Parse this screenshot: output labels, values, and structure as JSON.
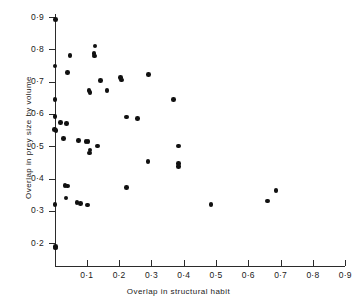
{
  "figure": {
    "background_color": "#ffffff",
    "point_color": "#111111",
    "axis_color": "#2b2b2b"
  },
  "chart_data": {
    "type": "scatter",
    "title": "",
    "xlabel": "Overlap in structural  habit",
    "ylabel": "Overlap in prey size by volume",
    "xlim": [
      0.0,
      0.9
    ],
    "ylim": [
      0.15,
      0.92
    ],
    "grid": false,
    "legend": null,
    "xticks": [
      0.1,
      0.2,
      0.3,
      0.4,
      0.5,
      0.6,
      0.7,
      0.8,
      0.9
    ],
    "xtick_labels": [
      "0·1",
      "0·2",
      "0·3",
      "0·4",
      "0·5",
      "0·6",
      "0·7",
      "0·8",
      "0·9"
    ],
    "yticks": [
      0.2,
      0.3,
      0.4,
      0.5,
      0.6,
      0.7,
      0.8,
      0.9
    ],
    "ytick_labels": [
      "0·2",
      "0·3",
      "0·4",
      "0·5",
      "0·6",
      "0·7",
      "0·8",
      "0·9"
    ],
    "points": [
      {
        "x": 0.003,
        "y": 0.893
      },
      {
        "x": 0.002,
        "y": 0.748
      },
      {
        "x": 0.048,
        "y": 0.78
      },
      {
        "x": 0.125,
        "y": 0.81
      },
      {
        "x": 0.122,
        "y": 0.787
      },
      {
        "x": 0.123,
        "y": 0.779
      },
      {
        "x": 0.04,
        "y": 0.728
      },
      {
        "x": 0.002,
        "y": 0.645
      },
      {
        "x": 0.142,
        "y": 0.704
      },
      {
        "x": 0.205,
        "y": 0.712
      },
      {
        "x": 0.207,
        "y": 0.705
      },
      {
        "x": 0.291,
        "y": 0.722
      },
      {
        "x": 0.107,
        "y": 0.672
      },
      {
        "x": 0.11,
        "y": 0.667
      },
      {
        "x": 0.163,
        "y": 0.673
      },
      {
        "x": 0.369,
        "y": 0.645
      },
      {
        "x": 0.001,
        "y": 0.592
      },
      {
        "x": 0.019,
        "y": 0.573
      },
      {
        "x": 0.037,
        "y": 0.57
      },
      {
        "x": 0.222,
        "y": 0.59
      },
      {
        "x": 0.257,
        "y": 0.585
      },
      {
        "x": 0.0,
        "y": 0.552
      },
      {
        "x": 0.005,
        "y": 0.549
      },
      {
        "x": 0.027,
        "y": 0.524
      },
      {
        "x": 0.075,
        "y": 0.518
      },
      {
        "x": 0.098,
        "y": 0.515
      },
      {
        "x": 0.104,
        "y": 0.514
      },
      {
        "x": 0.133,
        "y": 0.5
      },
      {
        "x": 0.383,
        "y": 0.5
      },
      {
        "x": 0.11,
        "y": 0.488
      },
      {
        "x": 0.109,
        "y": 0.479
      },
      {
        "x": 0.29,
        "y": 0.453
      },
      {
        "x": 0.383,
        "y": 0.447
      },
      {
        "x": 0.383,
        "y": 0.438
      },
      {
        "x": 0.032,
        "y": 0.378
      },
      {
        "x": 0.041,
        "y": 0.377
      },
      {
        "x": 0.222,
        "y": 0.372
      },
      {
        "x": 0.686,
        "y": 0.362
      },
      {
        "x": 0.036,
        "y": 0.339
      },
      {
        "x": 0.66,
        "y": 0.33
      },
      {
        "x": 0.002,
        "y": 0.319
      },
      {
        "x": 0.07,
        "y": 0.325
      },
      {
        "x": 0.08,
        "y": 0.323
      },
      {
        "x": 0.103,
        "y": 0.318
      },
      {
        "x": 0.484,
        "y": 0.319
      },
      {
        "x": 0.003,
        "y": 0.19
      },
      {
        "x": 0.003,
        "y": 0.185
      }
    ]
  }
}
